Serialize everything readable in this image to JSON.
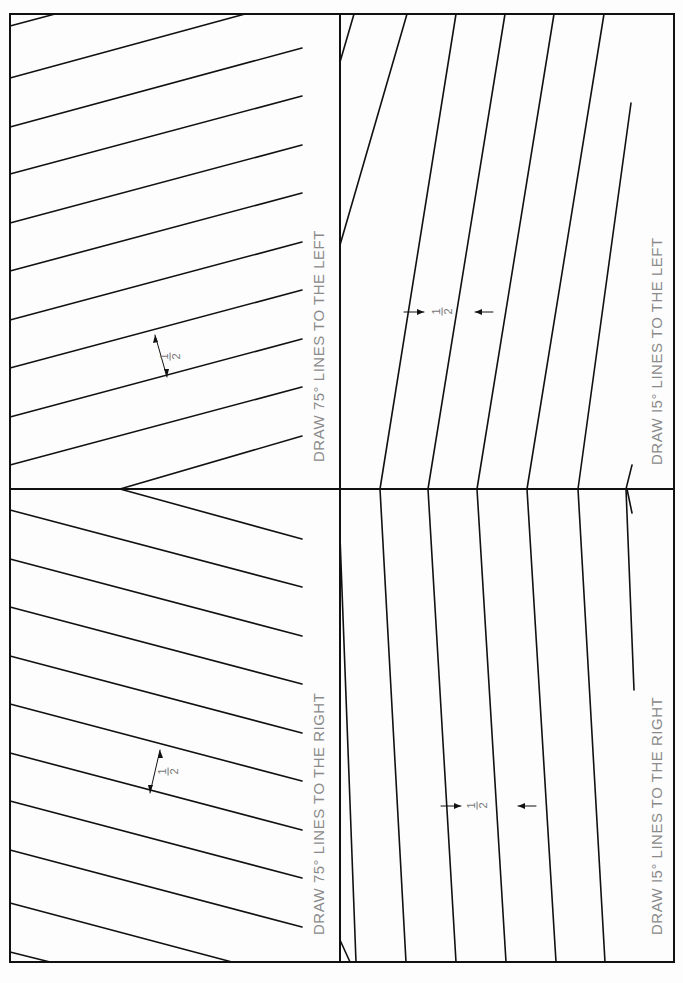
{
  "worksheet": {
    "orientation": "rotated-90-ccw",
    "line_color": "#111111",
    "label_color": "#8a8a8a",
    "panels": [
      {
        "id": "75-right",
        "position": "top-left",
        "instruction": "DRAW 75° LINES TO THE RIGHT",
        "spacing_label": {
          "numerator": "1",
          "denominator": "2"
        }
      },
      {
        "id": "75-left",
        "position": "bottom-left",
        "instruction": "DRAW 75° LINES TO THE LEFT",
        "spacing_label": {
          "numerator": "1",
          "denominator": "2"
        }
      },
      {
        "id": "15-right",
        "position": "top-right",
        "instruction": "DRAW I5° LINES TO THE RIGHT",
        "spacing_label": {
          "numerator": "1",
          "denominator": "2"
        }
      },
      {
        "id": "15-left",
        "position": "bottom-right",
        "instruction": "DRAW I5° LINES TO THE LEFT",
        "spacing_label": {
          "numerator": "1",
          "denominator": "2"
        }
      }
    ]
  }
}
